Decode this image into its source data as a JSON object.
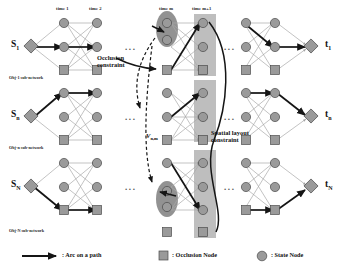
{
  "figure": {
    "colors": {
      "node_fill": "#9a9a9a",
      "node_stroke": "#4a4a4a",
      "occlusion_fill": "#8f8f8f",
      "thin_arc": "#a9a9a9",
      "path_arc": "#1a1a1a",
      "highlight_column": "#b0b0b0",
      "occlusion_group": "#8a8a8a",
      "text": "#111111"
    }
  },
  "time_labels": [
    {
      "id": "t1",
      "text": "time 1"
    },
    {
      "id": "t2",
      "text": "time 2"
    },
    {
      "id": "tm",
      "text": "time m"
    },
    {
      "id": "tm1",
      "text": "time m+1"
    }
  ],
  "subnetworks": [
    {
      "id": "obj-1",
      "caption": "Obj-1 sub-network",
      "source": "S",
      "source_sub": "1",
      "target": "t",
      "target_sub": "1"
    },
    {
      "id": "obj-n",
      "caption": "Obj-n sub-network",
      "source": "S",
      "source_sub": "n",
      "target": "t",
      "target_sub": "n"
    },
    {
      "id": "obj-N",
      "caption": "Obj-N sub-network",
      "source": "S",
      "source_sub": "N",
      "target": "t",
      "target_sub": "N"
    }
  ],
  "annotations": {
    "occlusion_constraint": "Occlusion\nconstraint",
    "occlusion_constraint_line1": "Occlusion",
    "occlusion_constraint_line2": "constraint",
    "spatial_constraint_line1": "Spatial layout",
    "spatial_constraint_line2": "constraint",
    "vertex_label": "V",
    "vertex_sub": "n,m"
  },
  "ellipses": [
    {
      "id": "gap-left-row1",
      "text": "..."
    },
    {
      "id": "gap-left-row2",
      "text": "..."
    },
    {
      "id": "gap-left-row3",
      "text": "..."
    },
    {
      "id": "gap-right-row1",
      "text": "..."
    },
    {
      "id": "gap-right-row2",
      "text": "..."
    },
    {
      "id": "gap-right-row3",
      "text": "..."
    }
  ],
  "legend": [
    {
      "id": "arc",
      "glyph": "arrow-icon",
      "text": ": Arc on a path"
    },
    {
      "id": "occlusion",
      "glyph": "square-icon",
      "text": ": Occlusion Node"
    },
    {
      "id": "state",
      "glyph": "circle-icon",
      "text": ": State Node"
    }
  ]
}
